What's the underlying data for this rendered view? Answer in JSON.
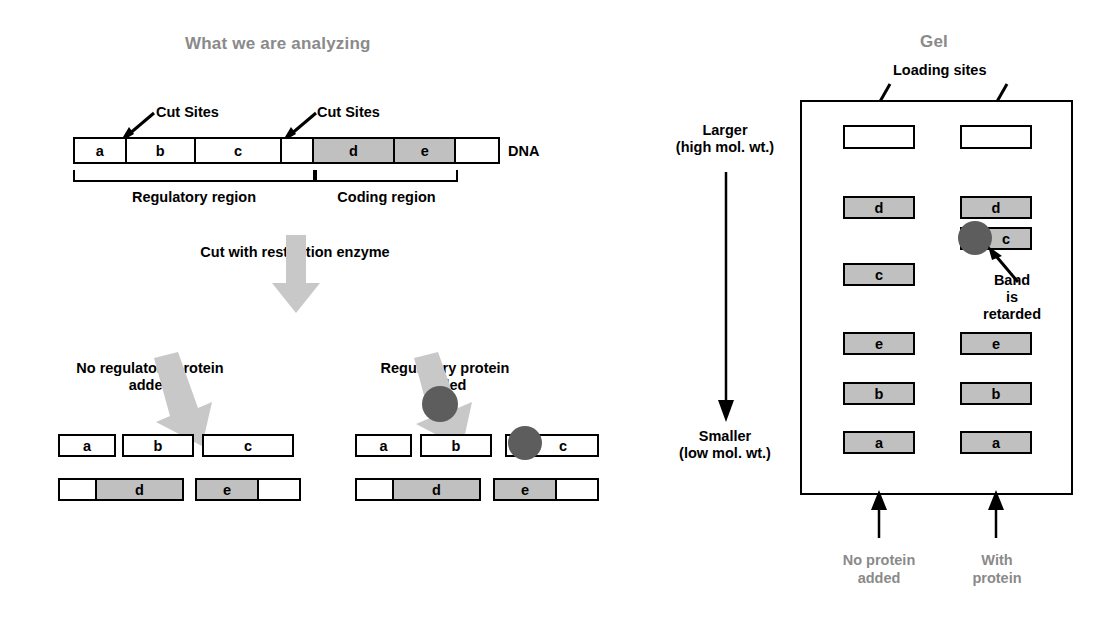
{
  "left_panel": {
    "title": "What we are analyzing",
    "cut_sites_label_1": "Cut Sites",
    "cut_sites_label_2": "Cut Sites",
    "dna_label": "DNA",
    "dna_segments": [
      {
        "label": "a",
        "shade": "white"
      },
      {
        "label": "b",
        "shade": "white"
      },
      {
        "label": "c",
        "shade": "white"
      },
      {
        "label": "",
        "shade": "white"
      },
      {
        "label": "d",
        "shade": "gray"
      },
      {
        "label": "e",
        "shade": "gray"
      },
      {
        "label": "",
        "shade": "white"
      }
    ],
    "regulatory_region_label": "Regulatory region",
    "coding_region_label": "Coding region",
    "cut_step_label": "Cut with restriction enzyme",
    "no_protein_label_line1": "No regulatory protein",
    "no_protein_label_line2": "added",
    "with_protein_label_line1": "Regulatory protein",
    "with_protein_label_line2": "added",
    "fragments_no_protein": {
      "row1": [
        {
          "label": "a",
          "parts": [
            {
              "shade": "white",
              "width": 54
            }
          ]
        },
        {
          "label": "b",
          "parts": [
            {
              "shade": "white",
              "width": 68
            }
          ]
        },
        {
          "label": "c",
          "parts": [
            {
              "shade": "white",
              "width": 88
            }
          ]
        }
      ],
      "row2": [
        {
          "label": "d",
          "parts": [
            {
              "shade": "white",
              "width": 35
            },
            {
              "shade": "gray",
              "width": 87
            }
          ]
        },
        {
          "label": "e",
          "parts": [
            {
              "shade": "gray",
              "width": 60
            },
            {
              "shade": "white",
              "width": 42
            }
          ]
        }
      ]
    },
    "fragments_with_protein": {
      "row1": [
        {
          "label": "a",
          "parts": [
            {
              "shade": "white",
              "width": 53
            }
          ]
        },
        {
          "label": "b",
          "parts": [
            {
              "shade": "white",
              "width": 68
            }
          ]
        },
        {
          "label": "c",
          "parts": [
            {
              "shade": "white",
              "width": 90
            }
          ],
          "protein_bound": true
        }
      ],
      "row2": [
        {
          "label": "d",
          "parts": [
            {
              "shade": "white",
              "width": 35
            },
            {
              "shade": "gray",
              "width": 87
            }
          ]
        },
        {
          "label": "e",
          "parts": [
            {
              "shade": "gray",
              "width": 60
            },
            {
              "shade": "white",
              "width": 42
            }
          ]
        }
      ]
    }
  },
  "gel_panel": {
    "title": "Gel",
    "loading_sites_label": "Loading sites",
    "larger_label_line1": "Larger",
    "larger_label_line2": "(high mol. wt.)",
    "smaller_label_line1": "Smaller",
    "smaller_label_line2": "(low  mol. wt.)",
    "band_retarded_line1": "Band",
    "band_retarded_line2": "is",
    "band_retarded_line3": "retarded",
    "lane1_caption_line1": "No protein",
    "lane1_caption_line2": "added",
    "lane2_caption_line1": "With",
    "lane2_caption_line2": "protein",
    "lane1_bands": [
      {
        "label": "",
        "y": 125,
        "well": true
      },
      {
        "label": "d",
        "y": 196
      },
      {
        "label": "c",
        "y": 263
      },
      {
        "label": "e",
        "y": 332
      },
      {
        "label": "b",
        "y": 382
      },
      {
        "label": "a",
        "y": 431
      }
    ],
    "lane2_bands": [
      {
        "label": "",
        "y": 125,
        "well": true
      },
      {
        "label": "d",
        "y": 196
      },
      {
        "label": "c",
        "y": 227,
        "protein_bound": true
      },
      {
        "label": "e",
        "y": 332
      },
      {
        "label": "b",
        "y": 382
      },
      {
        "label": "a",
        "y": 431
      }
    ]
  },
  "colors": {
    "gray_fill": "#c0c0c0",
    "arrow_gray": "#c8c8c8",
    "protein": "#5d5d5d",
    "title_gray": "#8a8a8a",
    "ink": "#000000"
  }
}
